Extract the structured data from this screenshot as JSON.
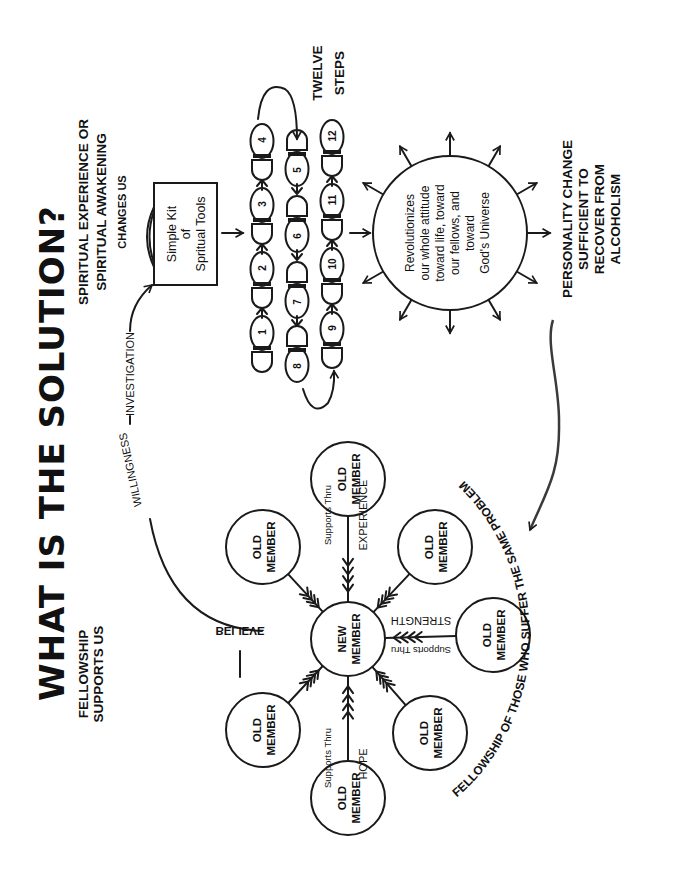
{
  "title": "WHAT IS THE SOLUTION?",
  "headings": {
    "fellowship": [
      "FELLOWSHIP",
      "SUPPORTS US"
    ],
    "spiritual": [
      "SPIRITUAL EXPERIENCE OR",
      "SPIRITUAL AWAKENING",
      "CHANGES US"
    ],
    "twelve_steps": [
      "TWELVE",
      "STEPS"
    ],
    "personality": [
      "PERSONALITY CHANGE",
      "SUFFICIENT TO",
      "RECOVER FROM",
      "ALCOHOLISM"
    ]
  },
  "kit": [
    "Simple Kit",
    "of",
    "Spritual Tools"
  ],
  "revolution_circle": [
    "Revolutionizes",
    "our whole attitude",
    "toward life, toward",
    "our fellows, and",
    "toward",
    "God's Universe"
  ],
  "path_labels": {
    "believe": "BELIEVE",
    "willingness": "WILLINGNESS",
    "investigation": "INVESTIGATION"
  },
  "steps": [
    "1",
    "2",
    "3",
    "4",
    "5",
    "6",
    "7",
    "8",
    "9",
    "10",
    "11",
    "12"
  ],
  "fellowship_circle": {
    "new_member": [
      "NEW",
      "MEMBER"
    ],
    "old_member": [
      "OLD",
      "MEMBER"
    ],
    "supports_thru": "Supports Thru",
    "experience": "EXPERIENCE",
    "hope": "HOPE",
    "strength": "STRENGTH"
  },
  "fellowship_arc": "FELLOWSHIP OF THOSE WHO SUFFER THE SAME PROBLEM",
  "colors": {
    "ink": "#1a1a1a",
    "paper": "#ffffff"
  }
}
